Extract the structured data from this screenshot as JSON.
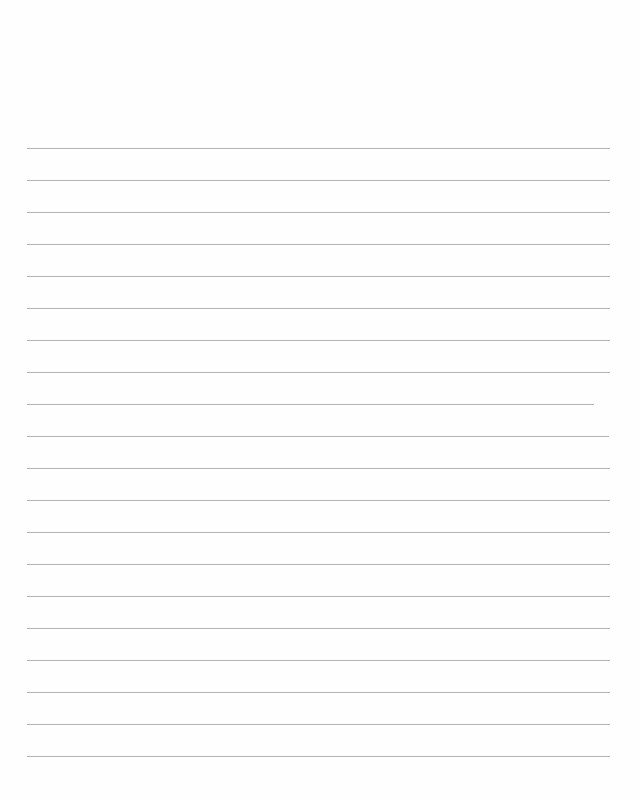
{
  "page": {
    "type": "blank lined paper",
    "background_color": "#fefefe",
    "line_color": "#b4b4b4",
    "line_count": 20,
    "first_line_y": 148,
    "line_spacing": 32,
    "lines": [
      {
        "index": 1,
        "x_start": 27,
        "x_end": 610
      },
      {
        "index": 2,
        "x_start": 27,
        "x_end": 610
      },
      {
        "index": 3,
        "x_start": 27,
        "x_end": 610
      },
      {
        "index": 4,
        "x_start": 27,
        "x_end": 610
      },
      {
        "index": 5,
        "x_start": 27,
        "x_end": 610
      },
      {
        "index": 6,
        "x_start": 27,
        "x_end": 610
      },
      {
        "index": 7,
        "x_start": 27,
        "x_end": 610
      },
      {
        "index": 8,
        "x_start": 27,
        "x_end": 610
      },
      {
        "index": 9,
        "x_start": 27,
        "x_end": 594
      },
      {
        "index": 10,
        "x_start": 27,
        "x_end": 609
      },
      {
        "index": 11,
        "x_start": 27,
        "x_end": 610
      },
      {
        "index": 12,
        "x_start": 27,
        "x_end": 610
      },
      {
        "index": 13,
        "x_start": 27,
        "x_end": 610
      },
      {
        "index": 14,
        "x_start": 27,
        "x_end": 610
      },
      {
        "index": 15,
        "x_start": 27,
        "x_end": 610
      },
      {
        "index": 16,
        "x_start": 27,
        "x_end": 610
      },
      {
        "index": 17,
        "x_start": 27,
        "x_end": 610
      },
      {
        "index": 18,
        "x_start": 27,
        "x_end": 610
      },
      {
        "index": 19,
        "x_start": 27,
        "x_end": 610
      },
      {
        "index": 20,
        "x_start": 27,
        "x_end": 610
      }
    ]
  }
}
